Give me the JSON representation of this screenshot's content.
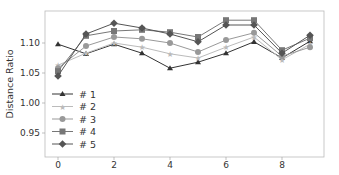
{
  "chart_data": {
    "type": "line",
    "title": "",
    "xlabel": "",
    "ylabel": "Distance Ratio",
    "x": [
      0,
      1,
      2,
      3,
      4,
      5,
      6,
      7,
      8,
      9
    ],
    "xticks": [
      0,
      2,
      4,
      6,
      8
    ],
    "yticks": [
      0.95,
      1.0,
      1.05,
      1.1
    ],
    "ytick_labels": [
      "0.95",
      "1.00",
      "1.05",
      "1.10"
    ],
    "xlim": [
      -0.45,
      9.5
    ],
    "ylim": [
      0.91,
      1.153
    ],
    "grid": false,
    "legend_position": "lower left",
    "series": [
      {
        "name": "# 1",
        "marker": "triangle",
        "color": "#333333",
        "values": [
          1.098,
          1.082,
          1.098,
          1.083,
          1.058,
          1.068,
          1.083,
          1.102,
          1.075,
          1.103
        ]
      },
      {
        "name": "# 2",
        "marker": "star",
        "color": "#bbbbbb",
        "values": [
          1.063,
          1.083,
          1.1,
          1.093,
          1.082,
          1.075,
          1.093,
          1.11,
          1.072,
          1.098
        ]
      },
      {
        "name": "# 3",
        "marker": "circle",
        "color": "#999999",
        "values": [
          1.058,
          1.095,
          1.11,
          1.107,
          1.1,
          1.085,
          1.105,
          1.117,
          1.078,
          1.093
        ]
      },
      {
        "name": "# 4",
        "marker": "square",
        "color": "#777777",
        "values": [
          1.053,
          1.112,
          1.12,
          1.122,
          1.118,
          1.11,
          1.138,
          1.138,
          1.088,
          1.108
        ]
      },
      {
        "name": "# 5",
        "marker": "diamond",
        "color": "#555555",
        "values": [
          1.045,
          1.115,
          1.133,
          1.125,
          1.115,
          1.102,
          1.13,
          1.13,
          1.083,
          1.113
        ]
      }
    ]
  }
}
